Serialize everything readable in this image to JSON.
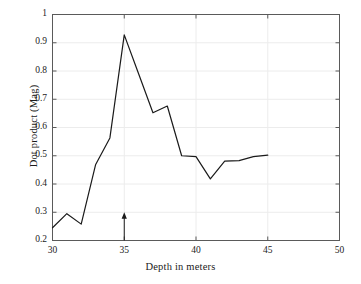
{
  "chart_data": {
    "type": "line",
    "title": "",
    "xlabel": "Depth in meters",
    "ylabel": "Dot product (Mag)",
    "xlim": [
      30,
      50
    ],
    "ylim": [
      0.2,
      1
    ],
    "xticks": [
      30,
      35,
      40,
      45,
      50
    ],
    "xtick_labels": [
      "30",
      "35",
      "40",
      "45",
      "50"
    ],
    "yticks": [
      0.2,
      0.3,
      0.4,
      0.5,
      0.6,
      0.7,
      0.8,
      0.9,
      1
    ],
    "ytick_labels": [
      "0.2",
      "0.3",
      "0.4",
      "0.5",
      "0.6",
      "0.7",
      "0.8",
      "0.9",
      "1"
    ],
    "grid": true,
    "legend": false,
    "x": [
      30,
      31,
      32,
      33,
      34,
      35,
      36,
      37,
      38,
      39,
      40,
      41,
      42,
      43,
      44,
      45
    ],
    "values": [
      0.245,
      0.295,
      0.258,
      0.468,
      0.563,
      0.928,
      0.79,
      0.652,
      0.676,
      0.5,
      0.497,
      0.418,
      0.481,
      0.483,
      0.497,
      0.502
    ],
    "series": [
      {
        "name": "Dot product (Mag)",
        "values": [
          0.245,
          0.295,
          0.258,
          0.468,
          0.563,
          0.928,
          0.79,
          0.652,
          0.676,
          0.5,
          0.497,
          0.418,
          0.481,
          0.483,
          0.497,
          0.502
        ]
      }
    ],
    "annotations": [
      {
        "name": "depth-marker-arrow",
        "type": "arrow",
        "x": 35,
        "y_from": 0.2,
        "y_to": 0.3,
        "direction": "up",
        "label": ""
      }
    ],
    "line_color": "#1a1a1a",
    "grid_color": "#ececec",
    "axis_color": "#5a5a5a",
    "background_color": "#ffffff"
  }
}
